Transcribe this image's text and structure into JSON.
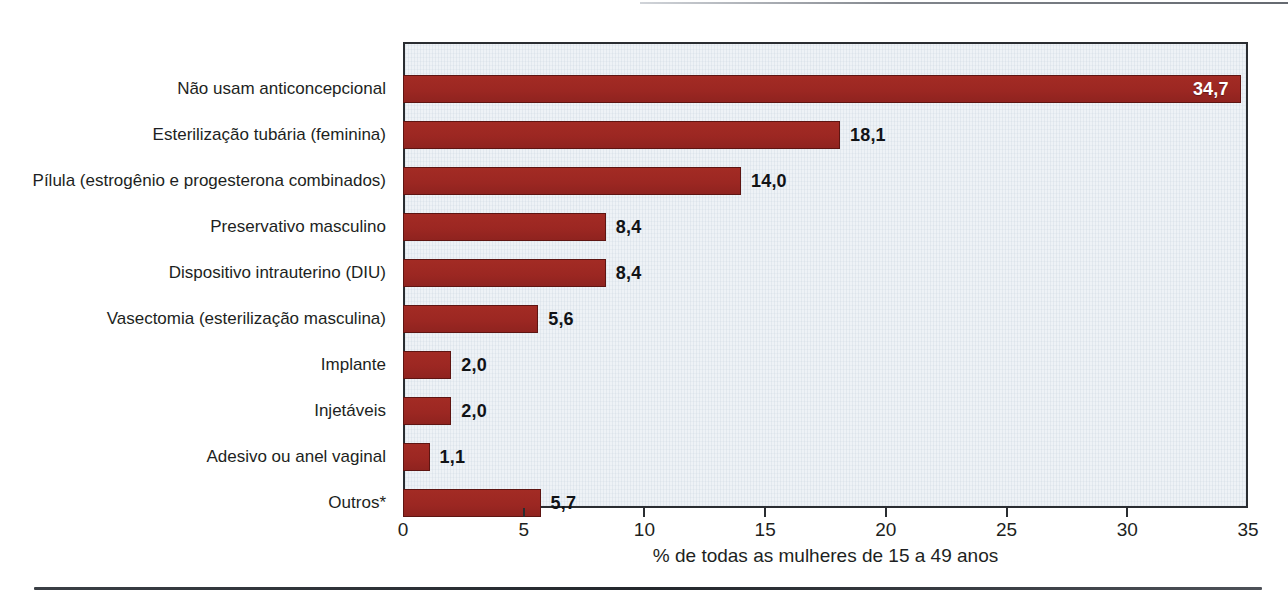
{
  "chart_data": {
    "type": "bar",
    "orientation": "horizontal",
    "title": "",
    "subtitle": "",
    "xlabel": "% de todas as mulheres de 15 a 49 anos",
    "ylabel": "",
    "xlim": [
      0,
      35
    ],
    "xticks": [
      "0",
      "5",
      "10",
      "15",
      "20",
      "25",
      "30",
      "35"
    ],
    "xtick_values": [
      0,
      5,
      10,
      15,
      20,
      25,
      30,
      35
    ],
    "grid": false,
    "legend": null,
    "categories": [
      "Não usam anticoncepcional",
      "Esterilização tubária (feminina)",
      "Pílula (estrogênio e progesterona combinados)",
      "Preservativo masculino",
      "Dispositivo intrauterino (DIU)",
      "Vasectomia (esterilização masculina)",
      "Implante",
      "Injetáveis",
      "Adesivo ou anel vaginal",
      "Outros*"
    ],
    "values": [
      34.7,
      18.1,
      14.0,
      8.4,
      8.4,
      5.6,
      2.0,
      2.0,
      1.1,
      5.7
    ],
    "value_labels": [
      "34,7",
      "18,1",
      "14,0",
      "8,4",
      "8,4",
      "5,6",
      "2,0",
      "2,0",
      "1,1",
      "5,7"
    ],
    "label_placement": [
      "inside",
      "outside",
      "outside",
      "outside",
      "outside",
      "outside",
      "outside",
      "outside",
      "outside",
      "outside"
    ],
    "bar_color": "#a32b24",
    "bar_edge_color": "#5e1512",
    "plot_background": "#eef2f6",
    "frame_color": "#2a2d31",
    "inside_label_color": "#ffffff",
    "outside_label_color": "#111316"
  },
  "axis": {
    "title": "% de todas as mulheres de 15 a 49 anos"
  }
}
